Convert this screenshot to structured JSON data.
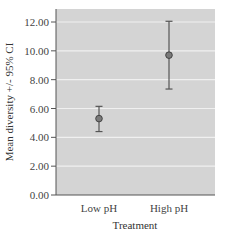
{
  "colors": {
    "plot_bg": "#d4d4d4",
    "grid": "#f0f0f0",
    "axis": "#555555",
    "errorbar": "#555555",
    "marker_fill": "#7a7a7a",
    "marker_stroke": "#444444"
  },
  "chart_data": {
    "type": "scatter",
    "subtype": "errorbar",
    "title": "",
    "xlabel": "Treatment",
    "ylabel": "Mean diversity +/- 95% CI",
    "categories": [
      "Low pH",
      "High pH"
    ],
    "series": [
      {
        "name": "Mean diversity",
        "values": [
          5.3,
          9.7
        ],
        "ci_lower": [
          4.4,
          7.35
        ],
        "ci_upper": [
          6.15,
          12.05
        ]
      }
    ],
    "ylim": [
      0,
      12
    ],
    "yticks": [
      0,
      2,
      4,
      6,
      8,
      10,
      12
    ],
    "ytick_labels": [
      "0.00",
      "2.00",
      "4.00",
      "6.00",
      "8.00",
      "10.00",
      "12.00"
    ],
    "grid": true,
    "legend": null
  }
}
